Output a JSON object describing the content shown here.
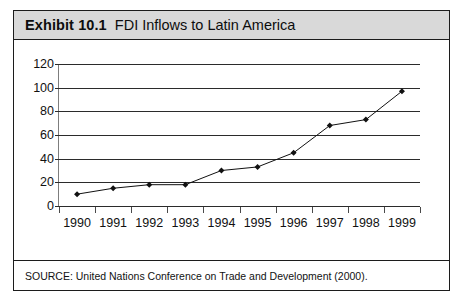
{
  "exhibit": {
    "label": "Exhibit 10.1",
    "title": "FDI Inflows to Latin America",
    "source": "SOURCE: United Nations Conference on Trade and Development (2000)."
  },
  "chart_data": {
    "type": "line",
    "title": "FDI Inflows to Latin America",
    "xlabel": "",
    "ylabel": "",
    "categories": [
      "1990",
      "1991",
      "1992",
      "1993",
      "1994",
      "1995",
      "1996",
      "1997",
      "1998",
      "1999"
    ],
    "values": [
      10,
      15,
      18,
      18,
      30,
      33,
      45,
      68,
      73,
      97
    ],
    "ylim": [
      0,
      120
    ],
    "yticks": [
      "0",
      "20",
      "40",
      "60",
      "80",
      "100",
      "120"
    ],
    "ytick_values": [
      0,
      20,
      40,
      60,
      80,
      100,
      120
    ],
    "grid": true,
    "legend": "none",
    "marker": "diamond",
    "line_color": "#111111",
    "marker_color": "#111111"
  },
  "colors": {
    "header_background": "#d9d9d9",
    "frame_border": "#1c1c1c",
    "gridline": "#2b2b2b",
    "text": "#111111"
  }
}
